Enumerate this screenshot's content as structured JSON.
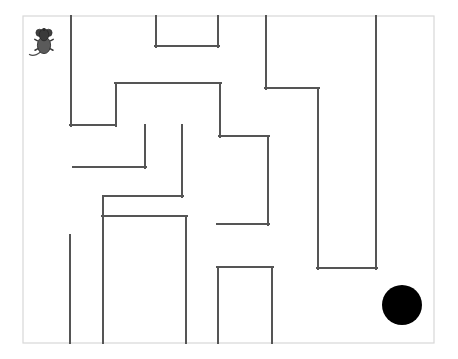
{
  "scene": {
    "title": "Mouse Maze Puzzle",
    "width": 458,
    "height": 359,
    "background_color": "#ffffff"
  },
  "maze": {
    "border": {
      "x": 23,
      "y": 16,
      "width": 411,
      "height": 327,
      "stroke_color": "#d8d8d8",
      "stroke_width": 1.2
    },
    "wall_color": "#555555",
    "wall_width": 2.0,
    "walls": [
      {
        "name": "wall-left-long-vertical",
        "x1": 71,
        "y1": 16,
        "x2": 71,
        "y2": 126
      },
      {
        "name": "wall-left-lower-horizontal",
        "x1": 70,
        "y1": 125,
        "x2": 116,
        "y2": 125
      },
      {
        "name": "wall-top-u-left-vertical",
        "x1": 156,
        "y1": 16,
        "x2": 156,
        "y2": 47
      },
      {
        "name": "wall-top-u-bottom-horizontal",
        "x1": 155,
        "y1": 46,
        "x2": 219,
        "y2": 46
      },
      {
        "name": "wall-top-u-right-vertical",
        "x1": 218,
        "y1": 16,
        "x2": 218,
        "y2": 47
      },
      {
        "name": "wall-upper-left-step-vertical",
        "x1": 116,
        "y1": 84,
        "x2": 116,
        "y2": 126
      },
      {
        "name": "wall-upper-center-horizontal",
        "x1": 115,
        "y1": 83,
        "x2": 221,
        "y2": 83
      },
      {
        "name": "wall-center-right-vertical",
        "x1": 220,
        "y1": 83,
        "x2": 220,
        "y2": 137
      },
      {
        "name": "wall-center-right-horizontal",
        "x1": 219,
        "y1": 136,
        "x2": 269,
        "y2": 136
      },
      {
        "name": "wall-right-inner-vertical",
        "x1": 268,
        "y1": 136,
        "x2": 268,
        "y2": 225
      },
      {
        "name": "wall-right-inner-bottom-horizontal",
        "x1": 217,
        "y1": 224,
        "x2": 269,
        "y2": 224
      },
      {
        "name": "wall-upper-right-vertical",
        "x1": 266,
        "y1": 16,
        "x2": 266,
        "y2": 89
      },
      {
        "name": "wall-upper-right-horizontal",
        "x1": 265,
        "y1": 88,
        "x2": 319,
        "y2": 88
      },
      {
        "name": "wall-far-right-inner-vertical",
        "x1": 318,
        "y1": 88,
        "x2": 318,
        "y2": 269
      },
      {
        "name": "wall-far-right-bottom-horizontal",
        "x1": 317,
        "y1": 268,
        "x2": 377,
        "y2": 268
      },
      {
        "name": "wall-far-right-outer-vertical",
        "x1": 376,
        "y1": 16,
        "x2": 376,
        "y2": 269
      },
      {
        "name": "wall-mid-left-horizontal",
        "x1": 73,
        "y1": 167,
        "x2": 146,
        "y2": 167
      },
      {
        "name": "wall-mid-left-vertical",
        "x1": 145,
        "y1": 125,
        "x2": 145,
        "y2": 168
      },
      {
        "name": "wall-mid-center-vertical",
        "x1": 182,
        "y1": 125,
        "x2": 182,
        "y2": 197
      },
      {
        "name": "wall-mid-center-horizontal",
        "x1": 104,
        "y1": 196,
        "x2": 183,
        "y2": 196
      },
      {
        "name": "wall-lower-left-vertical",
        "x1": 103,
        "y1": 196,
        "x2": 103,
        "y2": 343
      },
      {
        "name": "wall-lower-center-horizontal",
        "x1": 102,
        "y1": 216,
        "x2": 187,
        "y2": 216
      },
      {
        "name": "wall-lower-center-vertical",
        "x1": 186,
        "y1": 216,
        "x2": 186,
        "y2": 343
      },
      {
        "name": "wall-lower-left-short-vertical",
        "x1": 70,
        "y1": 235,
        "x2": 70,
        "y2": 343
      },
      {
        "name": "wall-bottom-u-left-vertical",
        "x1": 218,
        "y1": 267,
        "x2": 218,
        "y2": 343
      },
      {
        "name": "wall-bottom-u-top-horizontal",
        "x1": 217,
        "y1": 267,
        "x2": 273,
        "y2": 267
      },
      {
        "name": "wall-bottom-u-right-vertical",
        "x1": 272,
        "y1": 267,
        "x2": 272,
        "y2": 343
      }
    ]
  },
  "mouse": {
    "label": "mouse",
    "x": 44,
    "y": 42,
    "body_color": "#4a4a4a",
    "outline_color": "#2e2e2e"
  },
  "goal": {
    "label": "goal-hole",
    "x": 402,
    "y": 305,
    "radius": 20,
    "color": "#000000"
  }
}
